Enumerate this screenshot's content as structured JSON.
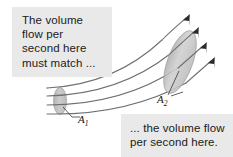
{
  "figure": {
    "name": "flow-tube-continuity-diagram",
    "background_color": "#ffffff",
    "callouts": {
      "top_left": {
        "text": "The volume\nflow per\nsecond here\nmust match ...",
        "background_color": "#e9e9e9",
        "text_color": "#1b1b1b"
      },
      "bottom_right": {
        "text": "... the volume flow\nper second here.",
        "background_color": "#e9e9e9",
        "text_color": "#1b1b1b"
      }
    },
    "labels": {
      "area_small": {
        "symbol": "A",
        "subscript": "1"
      },
      "area_large": {
        "symbol": "A",
        "subscript": "2"
      }
    },
    "cross_sections": {
      "small": {
        "name": "A1",
        "fill_color": "#c4c4c4",
        "stroke_color": "#9a9a9a",
        "center_x": 60,
        "center_y": 101,
        "radius_x": 6,
        "radius_y": 13
      },
      "large": {
        "name": "A2",
        "fill_color": "#c9c9c9",
        "stroke_color": "#9a9a9a",
        "center_x": 180,
        "center_y": 62,
        "radius_x": 12,
        "radius_y": 33,
        "rotation_deg": 20
      }
    },
    "streamlines": {
      "count": 4,
      "stroke_color": "#6f6f6f",
      "arrowhead_color": "#2b2b2b",
      "direction": "left-to-right, curving upward"
    },
    "leader_lines": {
      "stroke_color": "#3a3a3a"
    }
  }
}
